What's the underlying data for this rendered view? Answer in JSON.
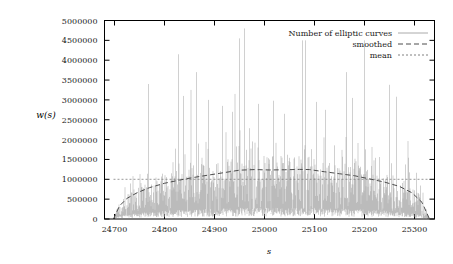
{
  "figure": {
    "background": "#ffffff",
    "frame_color": "#000000",
    "curve_color": "#a0a0a0",
    "smoothed_color": "#4d4d4d",
    "mean_color": "#808080"
  },
  "axes": {
    "ylabel": "w(s)",
    "xlabel": "s",
    "y_ticks": [
      "0",
      "500000",
      "1000000",
      "1500000",
      "2000000",
      "2500000",
      "3000000",
      "3500000",
      "4000000",
      "4500000",
      "5000000"
    ],
    "x_ticks": [
      "24700",
      "24800",
      "24900",
      "25000",
      "25100",
      "25200",
      "25300"
    ]
  },
  "legend": {
    "items": [
      {
        "label": "Number of elliptic curves",
        "style": "solid",
        "color": "#a0a0a0"
      },
      {
        "label": "smoothed",
        "style": "dashed",
        "color": "#4d4d4d"
      },
      {
        "label": "mean",
        "style": "dotted",
        "color": "#808080"
      }
    ]
  },
  "chart_data": {
    "type": "line",
    "title": "",
    "xlabel": "s",
    "ylabel": "w(s)",
    "xlim": [
      24680,
      25340
    ],
    "ylim": [
      0,
      5000000
    ],
    "xticks": [
      24700,
      24800,
      24900,
      25000,
      25100,
      25200,
      25300
    ],
    "yticks": [
      0,
      500000,
      1000000,
      1500000,
      2000000,
      2500000,
      3000000,
      3500000,
      4000000,
      4500000,
      5000000
    ],
    "grid": false,
    "legend_position": "top-right",
    "series": [
      {
        "name": "Number of elliptic curves",
        "style": "solid",
        "color": "#a0a0a0",
        "description": "Highly oscillatory spiky count of elliptic curves per conductor-like parameter s; envelope is a broad arch peaking near s=25000 with frequent tall outlier spikes up to 4.8e6.",
        "x_start": 24698,
        "x_end": 25330,
        "x_step": 1,
        "envelope_peak": 1250000,
        "max_value": 4800000,
        "notable_peaks": [
          {
            "x": 24768,
            "y": 3400000
          },
          {
            "x": 24828,
            "y": 4150000
          },
          {
            "x": 24838,
            "y": 3100000
          },
          {
            "x": 24864,
            "y": 3700000
          },
          {
            "x": 24888,
            "y": 3000000
          },
          {
            "x": 24916,
            "y": 2850000
          },
          {
            "x": 24936,
            "y": 2700000
          },
          {
            "x": 24950,
            "y": 4550000
          },
          {
            "x": 24960,
            "y": 4800000
          },
          {
            "x": 24988,
            "y": 2900000
          },
          {
            "x": 25018,
            "y": 2980000
          },
          {
            "x": 25040,
            "y": 2650000
          },
          {
            "x": 25076,
            "y": 4500000
          },
          {
            "x": 25082,
            "y": 4500000
          },
          {
            "x": 25104,
            "y": 2950000
          },
          {
            "x": 25122,
            "y": 2750000
          },
          {
            "x": 25164,
            "y": 3700000
          },
          {
            "x": 25176,
            "y": 3050000
          },
          {
            "x": 25200,
            "y": 4500000
          },
          {
            "x": 25250,
            "y": 3380000
          },
          {
            "x": 25264,
            "y": 3080000
          }
        ]
      },
      {
        "name": "smoothed",
        "style": "dashed",
        "color": "#4d4d4d",
        "description": "Smoothed arch rising from 0 at s=24698, reaching about 1250000 near s=24950-25100, then falling to 0 near s=25330.",
        "points": [
          {
            "x": 24698,
            "y": 0
          },
          {
            "x": 24710,
            "y": 330000
          },
          {
            "x": 24725,
            "y": 520000
          },
          {
            "x": 24745,
            "y": 660000
          },
          {
            "x": 24770,
            "y": 790000
          },
          {
            "x": 24800,
            "y": 900000
          },
          {
            "x": 24830,
            "y": 980000
          },
          {
            "x": 24860,
            "y": 1050000
          },
          {
            "x": 24890,
            "y": 1110000
          },
          {
            "x": 24920,
            "y": 1170000
          },
          {
            "x": 24950,
            "y": 1230000
          },
          {
            "x": 24980,
            "y": 1245000
          },
          {
            "x": 25010,
            "y": 1235000
          },
          {
            "x": 25040,
            "y": 1240000
          },
          {
            "x": 25070,
            "y": 1250000
          },
          {
            "x": 25090,
            "y": 1245000
          },
          {
            "x": 25120,
            "y": 1190000
          },
          {
            "x": 25150,
            "y": 1140000
          },
          {
            "x": 25180,
            "y": 1090000
          },
          {
            "x": 25210,
            "y": 1010000
          },
          {
            "x": 25240,
            "y": 930000
          },
          {
            "x": 25270,
            "y": 820000
          },
          {
            "x": 25295,
            "y": 660000
          },
          {
            "x": 25315,
            "y": 420000
          },
          {
            "x": 25330,
            "y": 0
          }
        ]
      },
      {
        "name": "mean",
        "style": "dotted",
        "color": "#808080",
        "description": "Horizontal constant mean line.",
        "value": 1000000
      }
    ]
  }
}
